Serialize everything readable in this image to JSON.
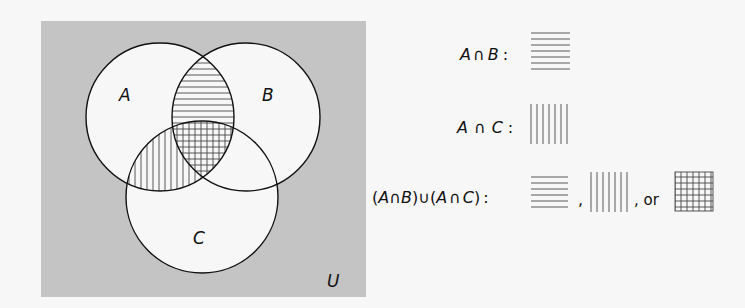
{
  "diagram": {
    "type": "venn",
    "universe_label": "U",
    "sets": [
      {
        "name": "A",
        "label": "A"
      },
      {
        "name": "B",
        "label": "B"
      },
      {
        "name": "C",
        "label": "C"
      }
    ],
    "colors": {
      "universe_fill": "#c4c4c4",
      "circle_fill": "#f7f7f7",
      "stroke": "#111111",
      "hatch": "#555555"
    },
    "shaded_regions": [
      {
        "region": "A∩B",
        "pattern": "horizontal"
      },
      {
        "region": "A∩C",
        "pattern": "vertical"
      },
      {
        "region": "A∩B∩C",
        "pattern": "crosshatch"
      }
    ]
  },
  "legend": {
    "row1": {
      "expr_A": "A",
      "expr_op": "∩",
      "expr_B": "B",
      "colon": ":",
      "pattern": "horizontal"
    },
    "row2": {
      "expr_A": "A",
      "expr_op": "∩",
      "expr_C": "C",
      "colon": ":",
      "pattern": "vertical"
    },
    "row3": {
      "open1": "(",
      "a1": "A",
      "op1": "∩",
      "b": "B",
      "close1": ")",
      "union": "∪",
      "open2": "(",
      "a2": "A",
      "op2": "∩",
      "c": "C",
      "close2": ")",
      "colon": ":",
      "sep1": ",",
      "sep2": ", or",
      "patterns": [
        "horizontal",
        "vertical",
        "crosshatch"
      ]
    }
  }
}
